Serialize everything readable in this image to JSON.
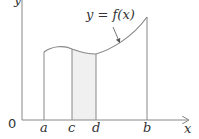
{
  "diagram": {
    "curve_label": "y = f(x)",
    "origin_label": "0",
    "x_axis_label": "x",
    "y_axis_label": "y",
    "x_ticks": [
      "a",
      "c",
      "d",
      "b"
    ],
    "shaded_region": {
      "from": "c",
      "to": "d",
      "color": "#f0f0f0"
    },
    "line_color": "#888888"
  }
}
